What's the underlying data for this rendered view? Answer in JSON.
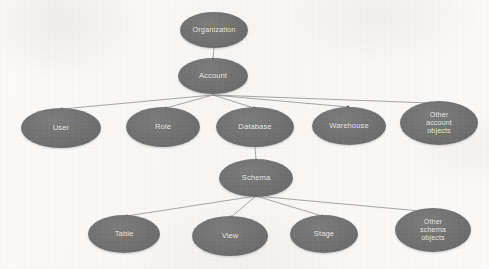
{
  "diagram": {
    "type": "tree",
    "colors": {
      "node_fill": "#6f6f6f",
      "node_text": "#f2f1ef",
      "edge": "#8b8b8b",
      "edge_dot": "#5e5e5e",
      "background": "#fbfaf9"
    },
    "nodes": [
      {
        "id": "organization",
        "label": "Organization",
        "lines": [
          "Organization"
        ],
        "cx": 214,
        "cy": 30,
        "rx": 34,
        "ry": 18,
        "font_size": 7.4,
        "level": 0
      },
      {
        "id": "account",
        "label": "Account",
        "lines": [
          "Account"
        ],
        "cx": 213,
        "cy": 76,
        "rx": 35,
        "ry": 18,
        "font_size": 7.6,
        "level": 1
      },
      {
        "id": "user",
        "label": "User",
        "lines": [
          "User"
        ],
        "cx": 61,
        "cy": 128,
        "rx": 40,
        "ry": 20,
        "font_size": 7.6,
        "level": 2
      },
      {
        "id": "role",
        "label": "Role",
        "lines": [
          "Role"
        ],
        "cx": 163,
        "cy": 127,
        "rx": 37,
        "ry": 20,
        "font_size": 7.6,
        "level": 2
      },
      {
        "id": "database",
        "label": "Database",
        "lines": [
          "Database"
        ],
        "cx": 255,
        "cy": 127,
        "rx": 39,
        "ry": 20,
        "font_size": 7.6,
        "level": 2
      },
      {
        "id": "warehouse",
        "label": "Warehouse",
        "lines": [
          "Warehouse"
        ],
        "cx": 349,
        "cy": 126,
        "rx": 37,
        "ry": 19,
        "font_size": 7.6,
        "level": 2
      },
      {
        "id": "other_account",
        "label": "Other account objects",
        "lines": [
          "Other",
          "account",
          "objects"
        ],
        "cx": 439,
        "cy": 123,
        "rx": 39,
        "ry": 22,
        "font_size": 7.2,
        "level": 2
      },
      {
        "id": "schema",
        "label": "Schema",
        "lines": [
          "Schema"
        ],
        "cx": 256,
        "cy": 178,
        "rx": 37,
        "ry": 19,
        "font_size": 7.6,
        "level": 3
      },
      {
        "id": "table",
        "label": "Table",
        "lines": [
          "Table"
        ],
        "cx": 124,
        "cy": 234,
        "rx": 36,
        "ry": 19,
        "font_size": 7.6,
        "level": 4
      },
      {
        "id": "view",
        "label": "View",
        "lines": [
          "View"
        ],
        "cx": 230,
        "cy": 236,
        "rx": 38,
        "ry": 20,
        "font_size": 7.6,
        "level": 4
      },
      {
        "id": "stage",
        "label": "Stage",
        "lines": [
          "Stage"
        ],
        "cx": 324,
        "cy": 234,
        "rx": 34,
        "ry": 19,
        "font_size": 7.6,
        "level": 4
      },
      {
        "id": "other_schema",
        "label": "Other schema objects",
        "lines": [
          "Other",
          "schema",
          "objects"
        ],
        "cx": 433,
        "cy": 230,
        "rx": 38,
        "ry": 22,
        "font_size": 7.2,
        "level": 4
      }
    ],
    "edges": [
      {
        "from": "organization",
        "to": "account",
        "x1": 214,
        "y1": 48,
        "x2": 213,
        "y2": 59
      },
      {
        "from": "account",
        "to": "user",
        "x1": 213,
        "y1": 95,
        "x2": 62,
        "y2": 109
      },
      {
        "from": "account",
        "to": "role",
        "x1": 213,
        "y1": 95,
        "x2": 166,
        "y2": 108
      },
      {
        "from": "account",
        "to": "database",
        "x1": 213,
        "y1": 95,
        "x2": 254,
        "y2": 108
      },
      {
        "from": "account",
        "to": "warehouse",
        "x1": 213,
        "y1": 95,
        "x2": 348,
        "y2": 107
      },
      {
        "from": "account",
        "to": "other_account",
        "x1": 213,
        "y1": 95,
        "x2": 430,
        "y2": 103
      },
      {
        "from": "database",
        "to": "schema",
        "x1": 255,
        "y1": 147,
        "x2": 256,
        "y2": 160
      },
      {
        "from": "schema",
        "to": "table",
        "x1": 256,
        "y1": 196,
        "x2": 127,
        "y2": 216
      },
      {
        "from": "schema",
        "to": "view",
        "x1": 256,
        "y1": 196,
        "x2": 231,
        "y2": 217
      },
      {
        "from": "schema",
        "to": "stage",
        "x1": 256,
        "y1": 196,
        "x2": 322,
        "y2": 216
      },
      {
        "from": "schema",
        "to": "other_schema",
        "x1": 256,
        "y1": 196,
        "x2": 420,
        "y2": 211
      }
    ]
  }
}
